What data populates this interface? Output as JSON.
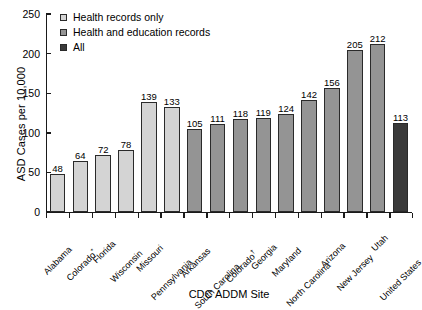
{
  "chart_data": {
    "type": "bar",
    "title": "",
    "xlabel": "CDC ADDM Site",
    "ylabel": "ASD Cases per 10,000",
    "ylim": [
      0,
      250
    ],
    "yticks": [
      0,
      50,
      100,
      150,
      200,
      250
    ],
    "grid": false,
    "legend_position": "top-left",
    "categories": [
      "Alabama",
      "Colorado*",
      "Florida",
      "Wisconsin",
      "Missouri",
      "Pennsylvania",
      "Arkansas",
      "South Carolina",
      "Colorado†",
      "Georgia",
      "Maryland",
      "North Carolina",
      "Arizona",
      "New Jersey",
      "Utah",
      "United States"
    ],
    "values": [
      48,
      64,
      72,
      78,
      139,
      133,
      105,
      111,
      118,
      119,
      124,
      142,
      156,
      205,
      212,
      113
    ],
    "groups": [
      "health",
      "health",
      "health",
      "health",
      "health",
      "health",
      "both",
      "both",
      "both",
      "both",
      "both",
      "both",
      "both",
      "both",
      "both",
      "all"
    ],
    "legend": [
      {
        "key": "health",
        "label": "Health records only",
        "color": "#d4d4d4"
      },
      {
        "key": "both",
        "label": "Health and education records",
        "color": "#949494"
      },
      {
        "key": "all",
        "label": "All",
        "color": "#3a3a3a"
      }
    ]
  }
}
